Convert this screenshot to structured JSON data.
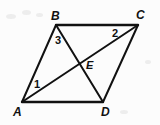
{
  "figure": {
    "kind": "geometry-diagram",
    "width": 160,
    "height": 125,
    "background_color": "#fcfcfc",
    "stroke_color": "#111111",
    "stroke_width": 2,
    "label_color": "#111111"
  },
  "vertices": [
    {
      "id": "A",
      "label": "A",
      "x": 22,
      "y": 102,
      "label_x": 13,
      "label_y": 106
    },
    {
      "id": "B",
      "label": "B",
      "x": 56,
      "y": 25,
      "label_x": 51,
      "label_y": 10
    },
    {
      "id": "C",
      "label": "C",
      "x": 138,
      "y": 25,
      "label_x": 136,
      "label_y": 9
    },
    {
      "id": "D",
      "label": "D",
      "x": 103,
      "y": 102,
      "label_x": 101,
      "label_y": 106
    }
  ],
  "interior_points": [
    {
      "id": "E",
      "label": "E",
      "x": 81,
      "y": 63,
      "label_x": 86,
      "label_y": 60
    }
  ],
  "angle_labels": [
    {
      "id": "1",
      "label": "1",
      "x": 34,
      "y": 79,
      "at_vertex": "A",
      "description": "angle BAC at vertex A"
    },
    {
      "id": "2",
      "label": "2",
      "x": 112,
      "y": 28,
      "at_vertex": "C",
      "description": "angle ACB at vertex C"
    },
    {
      "id": "3",
      "label": "3",
      "x": 55,
      "y": 35,
      "at_vertex": "B",
      "description": "angle ABD at vertex B"
    }
  ],
  "edges": [
    {
      "id": "AB",
      "from": "A",
      "to": "B",
      "role": "side"
    },
    {
      "id": "BC",
      "from": "B",
      "to": "C",
      "role": "side"
    },
    {
      "id": "CD",
      "from": "C",
      "to": "D",
      "role": "side"
    },
    {
      "id": "DA",
      "from": "D",
      "to": "A",
      "role": "side"
    },
    {
      "id": "AC",
      "from": "A",
      "to": "C",
      "role": "diagonal"
    },
    {
      "id": "BD",
      "from": "B",
      "to": "D",
      "role": "diagonal"
    }
  ]
}
